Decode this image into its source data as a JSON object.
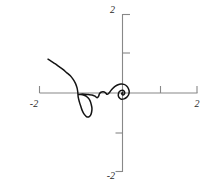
{
  "figure": {
    "name": "parametric-curve-plot",
    "width": 204,
    "height": 190,
    "background": "#ffffff",
    "curve_color": "#141414",
    "axis_color": "#888888"
  },
  "chart_data": {
    "type": "line",
    "title": "",
    "subtitle": "",
    "xlabel": "",
    "ylabel": "",
    "grid": false,
    "legend": null,
    "xlim": [
      -2.0,
      2.0
    ],
    "ylim": [
      -2.0,
      2.0
    ],
    "xticks": [
      -2,
      1,
      2
    ],
    "yticks": [
      2,
      1,
      -1,
      -2
    ],
    "xtick_labels": [
      "-2",
      "",
      "2"
    ],
    "ytick_labels": [
      "2",
      "",
      "",
      "-2"
    ],
    "visible_tick_labels": {
      "x_left": "-2",
      "x_right": "2",
      "y_top": "2",
      "y_bottom": "-2"
    },
    "axes_style": "centered-spines",
    "series": [
      {
        "name": "curve",
        "color": "#141414",
        "points": [
          [
            -2.0,
            0.86
          ],
          [
            -1.9,
            0.8
          ],
          [
            -1.8,
            0.74
          ],
          [
            -1.7,
            0.67
          ],
          [
            -1.6,
            0.6
          ],
          [
            -1.5,
            0.52
          ],
          [
            -1.4,
            0.44
          ],
          [
            -1.32,
            0.34
          ],
          [
            -1.26,
            0.24
          ],
          [
            -1.22,
            0.13
          ],
          [
            -1.2,
            0.02
          ],
          [
            -1.19,
            -0.1
          ],
          [
            -1.16,
            -0.22
          ],
          [
            -1.12,
            -0.34
          ],
          [
            -1.08,
            -0.45
          ],
          [
            -1.03,
            -0.54
          ],
          [
            -0.97,
            -0.6
          ],
          [
            -0.91,
            -0.61
          ],
          [
            -0.86,
            -0.57
          ],
          [
            -0.83,
            -0.49
          ],
          [
            -0.82,
            -0.39
          ],
          [
            -0.84,
            -0.29
          ],
          [
            -0.87,
            -0.2
          ],
          [
            -0.92,
            -0.13
          ],
          [
            -0.98,
            -0.08
          ],
          [
            -1.05,
            -0.05
          ],
          [
            -1.12,
            -0.04
          ],
          [
            -1.18,
            -0.04
          ],
          [
            -1.12,
            -0.03
          ],
          [
            -1.02,
            -0.03
          ],
          [
            -0.92,
            -0.04
          ],
          [
            -0.82,
            -0.05
          ],
          [
            -0.74,
            -0.08
          ],
          [
            -0.68,
            -0.12
          ],
          [
            -0.64,
            -0.08
          ],
          [
            -0.62,
            -0.02
          ],
          [
            -0.58,
            0.02
          ],
          [
            -0.52,
            0.03
          ],
          [
            -0.46,
            0.01
          ],
          [
            -0.42,
            -0.03
          ],
          [
            -0.38,
            -0.02
          ],
          [
            -0.33,
            0.04
          ],
          [
            -0.27,
            0.11
          ],
          [
            -0.2,
            0.17
          ],
          [
            -0.12,
            0.21
          ],
          [
            -0.04,
            0.23
          ],
          [
            0.04,
            0.22
          ],
          [
            0.11,
            0.18
          ],
          [
            0.16,
            0.11
          ],
          [
            0.18,
            0.03
          ],
          [
            0.16,
            -0.05
          ],
          [
            0.11,
            -0.11
          ],
          [
            0.04,
            -0.15
          ],
          [
            -0.03,
            -0.16
          ],
          [
            -0.08,
            -0.13
          ],
          [
            -0.11,
            -0.08
          ],
          [
            -0.11,
            -0.02
          ],
          [
            -0.09,
            0.03
          ],
          [
            -0.05,
            0.06
          ],
          [
            0.0,
            0.07
          ],
          [
            0.04,
            0.05
          ],
          [
            0.06,
            0.01
          ],
          [
            0.05,
            -0.03
          ],
          [
            0.02,
            -0.05
          ],
          [
            -0.01,
            -0.04
          ],
          [
            -0.02,
            -0.01
          ],
          [
            0.0,
            0.01
          ],
          [
            0.01,
            0.0
          ]
        ]
      }
    ]
  }
}
